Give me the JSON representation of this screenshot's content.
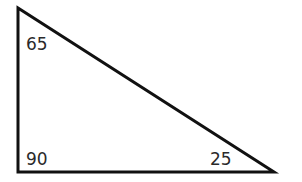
{
  "diagram": {
    "type": "right-triangle",
    "vertices": {
      "top": {
        "x": 18,
        "y": 8,
        "angle": "65"
      },
      "bottom_left": {
        "x": 18,
        "y": 172,
        "angle": "90"
      },
      "bottom_right": {
        "x": 274,
        "y": 172,
        "angle": "25"
      }
    },
    "stroke_color": "#111111",
    "angles": [
      "65",
      "90",
      "25"
    ]
  }
}
